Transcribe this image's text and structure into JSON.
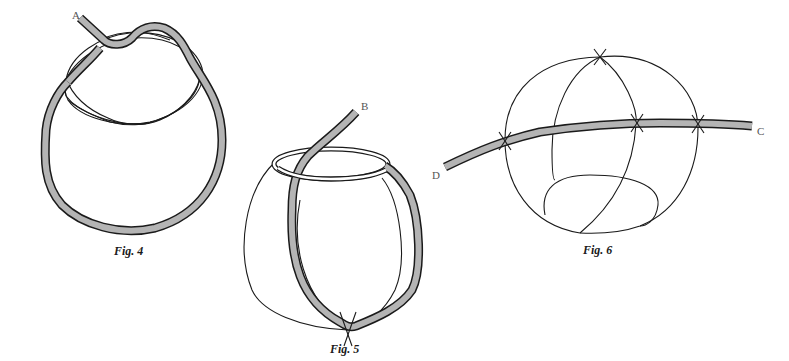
{
  "figures": [
    {
      "id": "fig4",
      "caption": "Fig. 4",
      "end_labels": [
        "A"
      ]
    },
    {
      "id": "fig5",
      "caption": "Fig. 5",
      "end_labels": [
        "B"
      ]
    },
    {
      "id": "fig6",
      "caption": "Fig. 6",
      "end_labels": [
        "C",
        "D"
      ]
    }
  ],
  "colors": {
    "rope_fill": "#b4b4b4",
    "outline": "#1a1a1a",
    "label": "#555555",
    "background": "#ffffff"
  }
}
